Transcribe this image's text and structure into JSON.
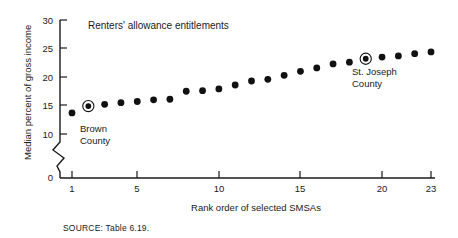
{
  "figure": {
    "title": "Renters' allowance entitlements",
    "source_note": "SOURCE: Table 6.19.",
    "ink_color": "#111111",
    "background_color": "#ffffff"
  },
  "annotations": {
    "brown": {
      "line1": "Brown",
      "line2": "County",
      "rank": 2,
      "value": 14.9
    },
    "st_joseph": {
      "line1": "St. Joseph",
      "line2": "County",
      "rank": 19,
      "value": 23.2
    }
  },
  "axes": {
    "y": {
      "label": "Median percent of gross income",
      "ticks": [
        "0",
        "10",
        "15",
        "20",
        "25",
        "30"
      ],
      "has_break": true
    },
    "x": {
      "label": "Rank order of selected SMSAs",
      "ticks": [
        "1",
        "5",
        "10",
        "15",
        "20",
        "23"
      ]
    }
  },
  "chart_data": {
    "type": "scatter",
    "title": "Renters' allowance entitlements",
    "xlabel": "Rank order of selected SMSAs",
    "ylabel": "Median percent of gross income",
    "xlim": [
      0.2,
      23.8
    ],
    "ylim": [
      9.0,
      30.0
    ],
    "xticks": [
      1,
      5,
      10,
      15,
      20,
      23
    ],
    "yticks": [
      10,
      15,
      20,
      25,
      30
    ],
    "y_axis_break_below": 10,
    "y_zero_shown": true,
    "grid": false,
    "legend": "none",
    "x": [
      1,
      2,
      3,
      4,
      5,
      6,
      7,
      8,
      9,
      10,
      11,
      12,
      13,
      14,
      15,
      16,
      17,
      18,
      19,
      20,
      21,
      22,
      23
    ],
    "values": [
      13.7,
      14.9,
      15.2,
      15.5,
      15.7,
      16.0,
      16.1,
      17.5,
      17.6,
      17.9,
      18.6,
      19.3,
      19.6,
      20.3,
      21.0,
      21.6,
      22.3,
      22.6,
      23.2,
      23.5,
      23.7,
      24.1,
      24.4
    ],
    "highlighted_points": [
      {
        "label": "Brown County",
        "x": 2,
        "y": 14.9
      },
      {
        "label": "St. Joseph County",
        "x": 19,
        "y": 23.2
      }
    ]
  }
}
